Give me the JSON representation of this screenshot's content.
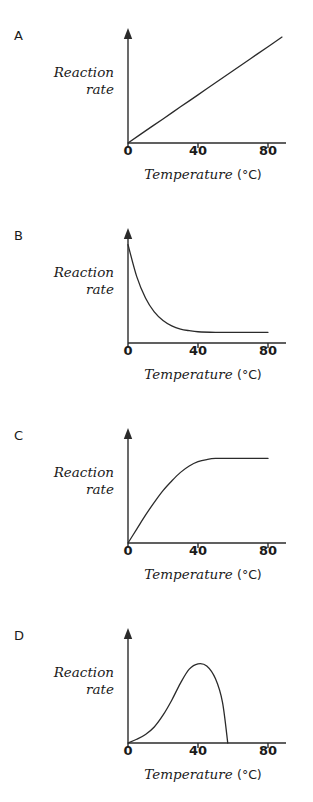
{
  "figure": {
    "panel_count": 4,
    "axis_color": "#2b2b2b",
    "curve_color": "#2b2b2b",
    "background": "#ffffff"
  },
  "axes": {
    "xlabel_text": "Temperature",
    "xlabel_unit": "(°C)",
    "ylabel_line1": "Reaction",
    "ylabel_line2": "rate",
    "xticks": [
      "0",
      "40",
      "80"
    ],
    "xtick_values": [
      0,
      40,
      80
    ],
    "xlim": [
      0,
      92
    ],
    "ylim": [
      0,
      1.05
    ],
    "yticks": [],
    "grid": false
  },
  "panels": [
    {
      "letter": "A"
    },
    {
      "letter": "B"
    },
    {
      "letter": "C"
    },
    {
      "letter": "D"
    }
  ],
  "chart_data": [
    {
      "type": "line",
      "panel": "A",
      "title": "",
      "xlabel": "Temperature (°C)",
      "ylabel": "Reaction rate",
      "xlim": [
        0,
        92
      ],
      "ylim": [
        0,
        1.05
      ],
      "xticks": [
        0,
        40,
        80
      ],
      "grid": false,
      "legend": null,
      "description": "Linear increase of reaction rate with temperature",
      "series": [
        {
          "name": "reaction rate",
          "x": [
            0,
            10,
            20,
            30,
            40,
            50,
            60,
            70,
            80,
            88
          ],
          "y": [
            0.0,
            0.113,
            0.225,
            0.338,
            0.45,
            0.563,
            0.675,
            0.788,
            0.9,
            0.99
          ]
        }
      ]
    },
    {
      "type": "line",
      "panel": "B",
      "title": "",
      "xlabel": "Temperature (°C)",
      "ylabel": "Reaction rate",
      "xlim": [
        0,
        92
      ],
      "ylim": [
        0,
        1.05
      ],
      "xticks": [
        0,
        40,
        80
      ],
      "grid": false,
      "legend": null,
      "description": "Exponential decay of reaction rate with temperature, plateauing above 40 degrees",
      "series": [
        {
          "name": "reaction rate",
          "x": [
            0,
            5,
            10,
            15,
            20,
            25,
            30,
            35,
            40,
            50,
            60,
            70,
            80
          ],
          "y": [
            0.92,
            0.62,
            0.42,
            0.29,
            0.21,
            0.16,
            0.13,
            0.115,
            0.105,
            0.1,
            0.1,
            0.1,
            0.1
          ]
        }
      ]
    },
    {
      "type": "line",
      "panel": "C",
      "title": "",
      "xlabel": "Temperature (°C)",
      "ylabel": "Reaction rate",
      "xlim": [
        0,
        92
      ],
      "ylim": [
        0,
        1.05
      ],
      "xticks": [
        0,
        40,
        80
      ],
      "grid": false,
      "legend": null,
      "description": "Saturating rise of reaction rate from origin, plateauing near 47 degrees",
      "series": [
        {
          "name": "reaction rate",
          "x": [
            0,
            5,
            10,
            15,
            20,
            25,
            30,
            35,
            40,
            45,
            50,
            60,
            70,
            80
          ],
          "y": [
            0.0,
            0.13,
            0.26,
            0.38,
            0.49,
            0.58,
            0.66,
            0.72,
            0.76,
            0.78,
            0.79,
            0.79,
            0.79,
            0.79
          ]
        }
      ]
    },
    {
      "type": "line",
      "panel": "D",
      "title": "",
      "xlabel": "Temperature (°C)",
      "ylabel": "Reaction rate",
      "xlim": [
        0,
        92
      ],
      "ylim": [
        0,
        1.05
      ],
      "xticks": [
        0,
        40,
        80
      ],
      "grid": false,
      "legend": null,
      "description": "Reaction rate rises to an optimum near 40 degrees then falls steeply to zero near 57 degrees",
      "series": [
        {
          "name": "reaction rate",
          "x": [
            0,
            5,
            10,
            15,
            20,
            25,
            30,
            35,
            40,
            45,
            50,
            54,
            57
          ],
          "y": [
            0.0,
            0.035,
            0.08,
            0.15,
            0.26,
            0.4,
            0.56,
            0.69,
            0.74,
            0.72,
            0.6,
            0.38,
            0.0
          ]
        }
      ]
    }
  ]
}
